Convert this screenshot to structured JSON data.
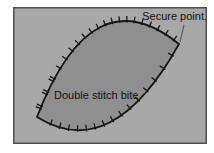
{
  "figure": {
    "labels": {
      "secure_point": "Secure point.",
      "double_stitch_bite": "Double stitch bite"
    },
    "colors": {
      "page_background": "#ffffff",
      "panel_fill": "#a8a8a8",
      "panel_border": "#4f4f4f",
      "wound_fill": "#8f8f8f",
      "wound_outline": "#161616",
      "stitch_mark": "#161616",
      "leader_line": "#5a5a5a",
      "label_text": "#141414"
    }
  }
}
